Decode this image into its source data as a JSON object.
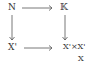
{
  "diagram": {
    "type": "commutative-square",
    "nodes": {
      "top_left": "N",
      "top_right": "𝕂",
      "bottom_left": "X'",
      "bottom_right": "X'×X'",
      "bottom_right_subscript": "X"
    },
    "arrows": [
      {
        "from": "N",
        "to": "𝕂",
        "direction": "right"
      },
      {
        "from": "N",
        "to": "X'",
        "direction": "down"
      },
      {
        "from": "𝕂",
        "to": "X'×_X X'",
        "direction": "down"
      },
      {
        "from": "X'",
        "to": "X'×_X X'",
        "direction": "right"
      }
    ],
    "colors": {
      "ink": "#333333",
      "background": "#ffffff"
    }
  }
}
